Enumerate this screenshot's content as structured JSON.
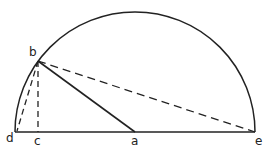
{
  "diagram": {
    "type": "geometry-semicircle",
    "labels": {
      "a": "a",
      "b": "b",
      "c": "c",
      "d": "d",
      "e": "e"
    },
    "points": {
      "a": [
        135,
        132
      ],
      "b": [
        38,
        61
      ],
      "c": [
        38,
        132
      ],
      "d": [
        15,
        132
      ],
      "e": [
        255,
        132
      ]
    },
    "segments": [
      {
        "from": "d",
        "to": "e",
        "style": "solid"
      },
      {
        "from": "b",
        "to": "a",
        "style": "solid"
      },
      {
        "from": "b",
        "to": "c",
        "style": "dashed"
      },
      {
        "from": "b",
        "to": "d",
        "style": "dashed"
      },
      {
        "from": "b",
        "to": "e",
        "style": "dashed"
      }
    ],
    "arc": {
      "center": "a",
      "radius": 120,
      "from": "d",
      "to": "e"
    },
    "colors": {
      "stroke": "#222222",
      "background": "#ffffff"
    }
  }
}
